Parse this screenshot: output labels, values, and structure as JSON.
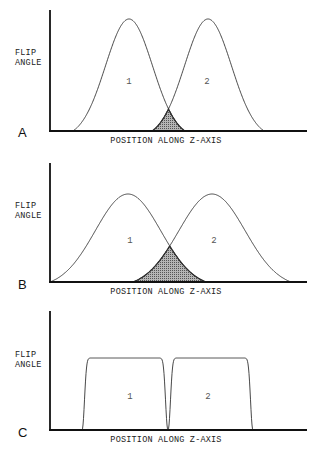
{
  "figure": {
    "ylabel_line1": "FLIP",
    "ylabel_line2": "ANGLE",
    "xlabel": "POSITION ALONG Z-AXIS",
    "colors": {
      "line": "#333333",
      "axis": "#111111",
      "overlap_fill": "#9a9a9a",
      "overlap_edge": "#222222"
    }
  },
  "panels": [
    {
      "letter": "A",
      "shape": "gaussian",
      "axis": {
        "x0": 50,
        "ytop": 10,
        "ybase": 131,
        "xend": 307
      },
      "label_y": 143,
      "ylabel_y1": 55,
      "ylabel_y2": 65,
      "letter_y": 137,
      "curves": [
        {
          "label": "1",
          "center": 129,
          "start": 73,
          "end": 185,
          "peak_y": 19,
          "label_x": 129,
          "label_y": 84
        },
        {
          "label": "2",
          "center": 208,
          "start": 152,
          "end": 263,
          "peak_y": 19,
          "label_x": 207,
          "label_y": 84
        }
      ]
    },
    {
      "letter": "B",
      "shape": "gaussian",
      "axis": {
        "x0": 50,
        "ytop": 163,
        "ybase": 282,
        "xend": 307
      },
      "label_y": 294,
      "ylabel_y1": 208,
      "ylabel_y2": 218,
      "letter_y": 289,
      "curves": [
        {
          "label": "1",
          "center": 128,
          "start": 50,
          "end": 205,
          "peak_y": 194,
          "label_x": 130,
          "label_y": 243
        },
        {
          "label": "2",
          "center": 212,
          "start": 134,
          "end": 291,
          "peak_y": 194,
          "label_x": 214,
          "label_y": 243
        }
      ]
    },
    {
      "letter": "C",
      "shape": "box",
      "axis": {
        "x0": 50,
        "ytop": 311,
        "ybase": 430,
        "xend": 307
      },
      "label_y": 442,
      "ylabel_y1": 357,
      "ylabel_y2": 367,
      "letter_y": 437,
      "curves": [
        {
          "label": "1",
          "start": 82,
          "end": 168,
          "peak_y": 358,
          "label_x": 130,
          "label_y": 399
        },
        {
          "label": "2",
          "start": 168,
          "end": 253,
          "peak_y": 358,
          "label_x": 208,
          "label_y": 399
        }
      ]
    }
  ]
}
